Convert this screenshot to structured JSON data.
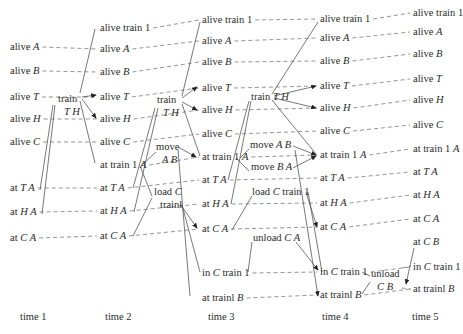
{
  "time_steps": [
    "time 1",
    "time 2",
    "time 3",
    "time 4",
    "time 5"
  ],
  "columns": [
    {
      "time": "time 1",
      "propositions": [
        {
          "id": "aliveA",
          "pre": "alive ",
          "it": "A"
        },
        {
          "id": "aliveB",
          "pre": "alive ",
          "it": "B"
        },
        {
          "id": "aliveT",
          "pre": "alive ",
          "it": "T"
        },
        {
          "id": "aliveH",
          "pre": "alive ",
          "it": "H"
        },
        {
          "id": "aliveC",
          "pre": "alive ",
          "it": "C"
        },
        {
          "id": "atTA",
          "pre": "at ",
          "it": "T A"
        },
        {
          "id": "atHA",
          "pre": "at ",
          "it": "H A"
        },
        {
          "id": "atCA",
          "pre": "at ",
          "it": "C A"
        }
      ]
    },
    {
      "time": "time 2",
      "propositions": [
        {
          "id": "aliveTrain1",
          "pre": "alive train 1",
          "it": ""
        },
        {
          "id": "aliveA",
          "pre": "alive ",
          "it": "A"
        },
        {
          "id": "aliveB",
          "pre": "alive ",
          "it": "B"
        },
        {
          "id": "aliveT",
          "pre": "alive ",
          "it": "T"
        },
        {
          "id": "aliveH",
          "pre": "alive ",
          "it": "H"
        },
        {
          "id": "aliveC",
          "pre": "alive ",
          "it": "C"
        },
        {
          "id": "atTrain1A",
          "pre": "at train 1 ",
          "it": "A"
        },
        {
          "id": "atTA",
          "pre": "at ",
          "it": "T A"
        },
        {
          "id": "atHA",
          "pre": "at ",
          "it": "H A"
        },
        {
          "id": "atCA",
          "pre": "at ",
          "it": "C A"
        }
      ]
    },
    {
      "time": "time 3",
      "propositions": [
        {
          "id": "aliveTrain1",
          "pre": "alive train 1",
          "it": ""
        },
        {
          "id": "aliveA",
          "pre": "alive ",
          "it": "A"
        },
        {
          "id": "aliveB",
          "pre": "alive ",
          "it": "B"
        },
        {
          "id": "aliveT",
          "pre": "alive ",
          "it": "T"
        },
        {
          "id": "aliveH",
          "pre": "alive ",
          "it": "H"
        },
        {
          "id": "aliveC",
          "pre": "alive ",
          "it": "C"
        },
        {
          "id": "atTrain1A",
          "pre": "at train 1 ",
          "it": "A"
        },
        {
          "id": "atTA",
          "pre": "at ",
          "it": "T A"
        },
        {
          "id": "atHA",
          "pre": "at ",
          "it": "H A"
        },
        {
          "id": "atCA",
          "pre": "at ",
          "it": "C A"
        },
        {
          "id": "inCTrain1",
          "pre": "in ",
          "it": "C",
          "post": " train 1"
        },
        {
          "id": "atTrain1B",
          "pre": "at trainl ",
          "it": "B"
        }
      ]
    },
    {
      "time": "time 4",
      "propositions": [
        {
          "id": "aliveTrain1",
          "pre": "alive train 1",
          "it": ""
        },
        {
          "id": "aliveA",
          "pre": "alive ",
          "it": "A"
        },
        {
          "id": "aliveB",
          "pre": "alive ",
          "it": "B"
        },
        {
          "id": "aliveT",
          "pre": "alive ",
          "it": "T"
        },
        {
          "id": "aliveH",
          "pre": "alive ",
          "it": "H"
        },
        {
          "id": "aliveC",
          "pre": "alive ",
          "it": "C"
        },
        {
          "id": "atTrain1A",
          "pre": "at train 1 ",
          "it": "A"
        },
        {
          "id": "atTA",
          "pre": "at ",
          "it": "T A"
        },
        {
          "id": "atHA",
          "pre": "at ",
          "it": "H A"
        },
        {
          "id": "atCA",
          "pre": "at ",
          "it": "C A"
        },
        {
          "id": "inCTrain1",
          "pre": "in ",
          "it": "C",
          "post": " train 1"
        },
        {
          "id": "atTrain1B",
          "pre": "at trainl ",
          "it": "B"
        }
      ]
    },
    {
      "time": "time 5",
      "propositions": [
        {
          "id": "aliveTrain1",
          "pre": "alive train 1",
          "it": ""
        },
        {
          "id": "aliveA",
          "pre": "alive ",
          "it": "A"
        },
        {
          "id": "aliveB",
          "pre": "alive ",
          "it": "B"
        },
        {
          "id": "aliveT",
          "pre": "alive ",
          "it": "T"
        },
        {
          "id": "aliveH",
          "pre": "alive ",
          "it": "H"
        },
        {
          "id": "aliveC",
          "pre": "alive ",
          "it": "C"
        },
        {
          "id": "atTrain1A",
          "pre": "at train 1 ",
          "it": "A"
        },
        {
          "id": "atTA",
          "pre": "at ",
          "it": "T A"
        },
        {
          "id": "atHA",
          "pre": "at ",
          "it": "H A"
        },
        {
          "id": "atCA",
          "pre": "at ",
          "it": "C A"
        },
        {
          "id": "atCB",
          "pre": "at ",
          "it": "C B"
        },
        {
          "id": "inCTrain1",
          "pre": "in ",
          "it": "C",
          "post": " train 1"
        },
        {
          "id": "atTrain1B",
          "pre": "at trainl ",
          "it": "B"
        }
      ]
    }
  ],
  "actions": [
    {
      "id": "train12",
      "step": "1-2",
      "line1": "train",
      "line2_it": "T H"
    },
    {
      "id": "train23",
      "step": "2-3",
      "line1": "train",
      "line2_it": "T H"
    },
    {
      "id": "moveAB23",
      "step": "2-3",
      "line1": "move",
      "line2_it": "A B"
    },
    {
      "id": "load23",
      "step": "2-3",
      "line1_pre": "load ",
      "line1_it": "C",
      "line2": "trainl"
    },
    {
      "id": "train34",
      "step": "3-4",
      "line1_pre": "train ",
      "line1_it": "T H"
    },
    {
      "id": "moveAB34",
      "step": "3-4",
      "line1_pre": "move ",
      "line1_it": "A B"
    },
    {
      "id": "moveBA34",
      "step": "3-4",
      "line1_pre": "move ",
      "line1_it": "B A"
    },
    {
      "id": "load34",
      "step": "3-4",
      "line1_pre": "load ",
      "line1_it": "C",
      "line1_post": " train 1"
    },
    {
      "id": "unload34",
      "step": "3-4",
      "line1_pre": "unload ",
      "line1_it": "C A"
    },
    {
      "id": "unload45",
      "step": "4-5",
      "line1": "unload",
      "line2_it": "C B"
    }
  ],
  "colors": {
    "ink": "#2a2a2a",
    "line": "#555555",
    "dash": "#7a7a7a",
    "background": "#ffffff"
  }
}
